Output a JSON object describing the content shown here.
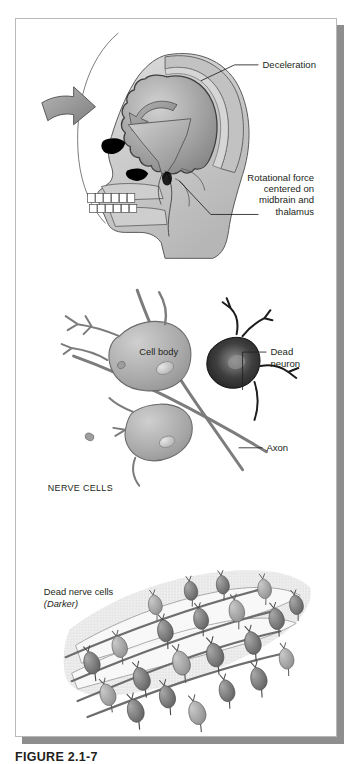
{
  "figure": {
    "caption": "FIGURE 2.1-7",
    "panel_border_color": "#b9b9b9",
    "shadow_color": "#8e8e8e",
    "background_color": "#ffffff",
    "ink_color": "#231f20"
  },
  "panels": [
    {
      "id": "head-injury-panel",
      "name": "head-injury-diagram",
      "subject": "lateral view of human head and skull with brain, showing impact forces",
      "labels": [
        {
          "id": "deceleration",
          "text": "Deceleration",
          "align": "left",
          "lines": [
            "Deceleration"
          ]
        },
        {
          "id": "rotational-force",
          "text": "Rotational force centered on midbrain and thalamus",
          "align": "right",
          "lines": [
            "Rotational force",
            "centered on",
            "midbrain and",
            "thalamus"
          ]
        }
      ],
      "graphics": [
        "impact-arrow",
        "rotational-arrow",
        "brainstem-force-arrow",
        "skull-outline",
        "brain",
        "teeth",
        "eye-socket",
        "nasal-cavity"
      ]
    },
    {
      "id": "nerve-cells-panel",
      "name": "nerve-cells-diagram",
      "subject": "neurons with one darkened dead neuron",
      "labels": [
        {
          "id": "dead-neuron",
          "text": "Dead neuron",
          "align": "left",
          "lines": [
            "Dead",
            "neuron"
          ]
        },
        {
          "id": "cell-body",
          "text": "Cell body",
          "align": "left",
          "lines": [
            "Cell body"
          ]
        },
        {
          "id": "axon",
          "text": "Axon",
          "align": "left",
          "lines": [
            "Axon"
          ]
        },
        {
          "id": "nerve-cells-title",
          "text": "NERVE CELLS",
          "align": "left",
          "lines": [
            "NERVE CELLS"
          ]
        }
      ],
      "graphics": [
        "healthy-neuron",
        "dead-neuron-shape",
        "axon-fiber",
        "dendrites",
        "nucleus",
        "debris-particles"
      ]
    },
    {
      "id": "dead-nerve-cells-panel",
      "name": "dead-nerve-cells-field",
      "subject": "dense field of nerve cells, dead ones shown darker",
      "labels": [
        {
          "id": "dead-nerve-cells",
          "text": "Dead nerve cells",
          "align": "left",
          "lines": [
            "Dead nerve cells"
          ]
        },
        {
          "id": "dead-nerve-cells-note",
          "text": "(Darker)",
          "align": "left",
          "style": "italic",
          "lines": [
            "(Darker)"
          ]
        }
      ],
      "graphics": [
        "cell-cluster",
        "stippled-tissue",
        "nerve-fibers"
      ]
    }
  ],
  "palette": {
    "tissue_light": "#d8d8d8",
    "tissue_mid": "#b3b3b3",
    "tissue_dark": "#8a8a8a",
    "cell_dark": "#3a3a3a",
    "outline": "#4d4d4d",
    "black": "#000000"
  }
}
